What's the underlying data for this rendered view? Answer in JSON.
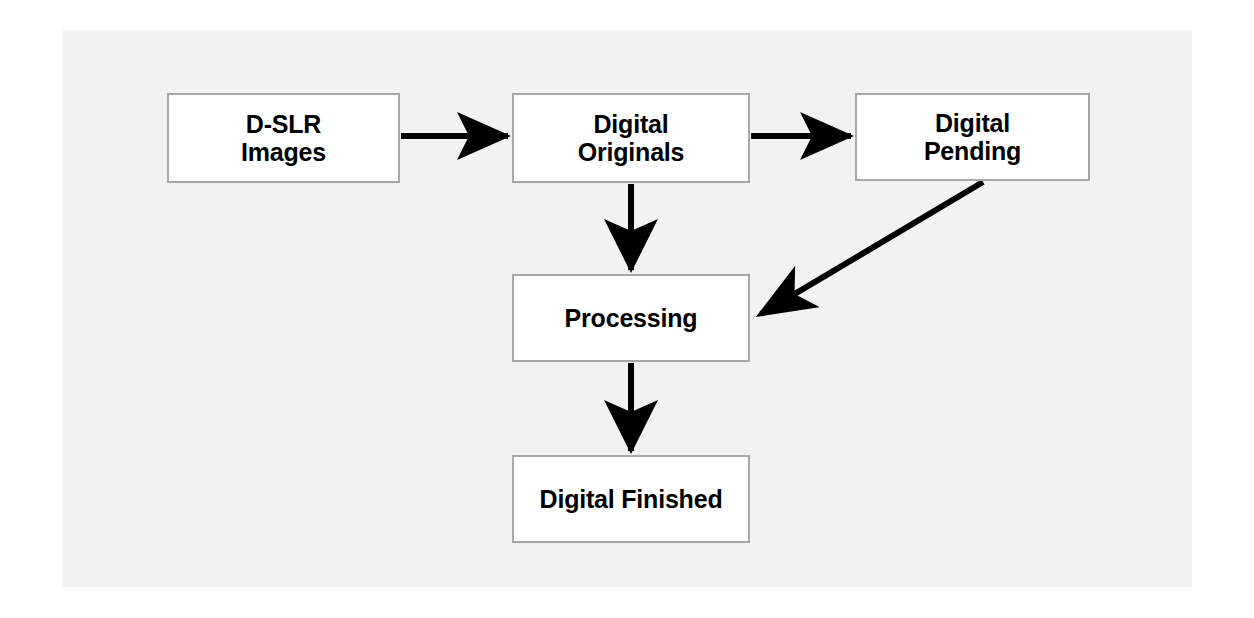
{
  "diagram": {
    "type": "flowchart",
    "background_color": "#f2f2f2",
    "page_color": "#ffffff",
    "node_fill": "#ffffff",
    "node_border_color": "#a8a8a8",
    "connector_color": "#000000",
    "nodes": [
      {
        "id": "d-slr-images",
        "label": "D-SLR\nImages",
        "x": 167,
        "y": 93,
        "w": 233,
        "h": 90
      },
      {
        "id": "digital-originals",
        "label": "Digital\nOriginals",
        "x": 512,
        "y": 93,
        "w": 238,
        "h": 90
      },
      {
        "id": "digital-pending",
        "label": "Digital\nPending",
        "x": 855,
        "y": 93,
        "w": 235,
        "h": 88
      },
      {
        "id": "processing",
        "label": "Processing",
        "x": 512,
        "y": 274,
        "w": 238,
        "h": 88
      },
      {
        "id": "digital-finished",
        "label": "Digital Finished",
        "x": 512,
        "y": 455,
        "w": 238,
        "h": 88
      }
    ],
    "edges": [
      {
        "id": "images-to-originals",
        "from": "d-slr-images",
        "to": "digital-originals",
        "direction": "right",
        "x1": 400,
        "y1": 136,
        "x2": 512,
        "y2": 136
      },
      {
        "id": "originals-to-pending",
        "from": "digital-originals",
        "to": "digital-pending",
        "direction": "right",
        "x1": 750,
        "y1": 136,
        "x2": 855,
        "y2": 136
      },
      {
        "id": "originals-to-processing",
        "from": "digital-originals",
        "to": "processing",
        "direction": "down",
        "x1": 631,
        "y1": 183,
        "x2": 631,
        "y2": 274
      },
      {
        "id": "pending-to-processing",
        "from": "digital-pending",
        "to": "processing",
        "direction": "diagonal-down-left",
        "x1": 982,
        "y1": 182,
        "x2": 757,
        "y2": 317
      },
      {
        "id": "processing-to-finished",
        "from": "processing",
        "to": "digital-finished",
        "direction": "down",
        "x1": 631,
        "y1": 362,
        "x2": 631,
        "y2": 455
      }
    ]
  }
}
